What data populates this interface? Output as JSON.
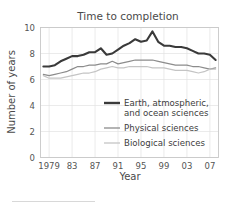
{
  "chart_data": {
    "type": "line",
    "title": "Time to completion",
    "xlabel": "Year",
    "ylabel": "Number of years",
    "xlim": [
      1977.5,
      2008.5
    ],
    "ylim": [
      0,
      10
    ],
    "grid": true,
    "legend_position": "center",
    "y_ticks": [
      "0",
      "2",
      "4",
      "6",
      "8",
      "10"
    ],
    "y_tick_values": [
      0,
      2,
      4,
      6,
      8,
      10
    ],
    "x_ticks": [
      "1979",
      "83",
      "87",
      "91",
      "95",
      "99",
      "03",
      "07"
    ],
    "x_tick_values": [
      1979,
      1983,
      1987,
      1991,
      1995,
      1999,
      2003,
      2007
    ],
    "x": [
      1978,
      1979,
      1980,
      1981,
      1982,
      1983,
      1984,
      1985,
      1986,
      1987,
      1988,
      1989,
      1990,
      1991,
      1992,
      1993,
      1994,
      1995,
      1996,
      1997,
      1998,
      1999,
      2000,
      2001,
      2002,
      2003,
      2004,
      2005,
      2006,
      2007,
      2008
    ],
    "series": [
      {
        "name": "Earth, atmospheric, and ocean sciences",
        "color": "#3a3a3a",
        "width": 2.1,
        "values": [
          7.0,
          7.0,
          7.1,
          7.4,
          7.6,
          7.8,
          7.8,
          7.9,
          8.1,
          8.1,
          8.4,
          7.9,
          8.0,
          8.3,
          8.6,
          8.8,
          9.1,
          8.9,
          9.0,
          9.7,
          8.9,
          8.6,
          8.6,
          8.5,
          8.5,
          8.4,
          8.2,
          8.0,
          8.0,
          7.9,
          7.5
        ]
      },
      {
        "name": "Physical sciences",
        "color": "#8c8c8c",
        "width": 1.25,
        "values": [
          6.4,
          6.3,
          6.4,
          6.5,
          6.6,
          6.8,
          7.0,
          7.0,
          7.1,
          7.1,
          7.2,
          7.2,
          7.4,
          7.2,
          7.3,
          7.4,
          7.5,
          7.5,
          7.5,
          7.5,
          7.4,
          7.3,
          7.2,
          7.1,
          7.1,
          7.1,
          7.0,
          7.0,
          6.9,
          6.8,
          6.9
        ]
      },
      {
        "name": "Biological sciences",
        "color": "#c4c4c4",
        "width": 1.25,
        "values": [
          6.3,
          6.1,
          6.1,
          6.1,
          6.2,
          6.3,
          6.4,
          6.5,
          6.5,
          6.6,
          6.8,
          6.9,
          7.0,
          6.9,
          6.9,
          7.0,
          7.0,
          7.0,
          7.0,
          6.9,
          6.9,
          6.9,
          6.8,
          6.7,
          6.7,
          6.7,
          6.6,
          6.5,
          6.6,
          6.8,
          6.8
        ]
      }
    ],
    "legend": [
      {
        "label_line1": "Earth, atmospheric,",
        "label_line2": "and ocean sciences",
        "color": "#3a3a3a",
        "width": 2.4
      },
      {
        "label_line1": "Physical sciences",
        "label_line2": "",
        "color": "#8c8c8c",
        "width": 1.3
      },
      {
        "label_line1": "Biological sciences",
        "label_line2": "",
        "color": "#c4c4c4",
        "width": 1.3
      }
    ]
  }
}
